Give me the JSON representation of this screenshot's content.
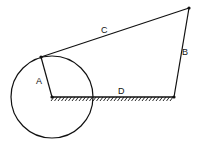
{
  "diagram": {
    "type": "four-bar linkage",
    "colors": {
      "stroke": "#111111",
      "background": "#ffffff"
    },
    "circle": {
      "cx": 52,
      "cy": 97,
      "r": 41
    },
    "points": {
      "ground_left": [
        52,
        97
      ],
      "crank_tip": [
        41,
        57
      ],
      "coupler_right": [
        189,
        8
      ],
      "ground_right": [
        174,
        97
      ]
    },
    "links": [
      {
        "id": "A",
        "label": "A",
        "from": "ground_left",
        "to": "crank_tip",
        "label_pos": [
          31,
          81
        ]
      },
      {
        "id": "B",
        "label": "B",
        "from": "ground_right",
        "to": "coupler_right",
        "label_pos": [
          183,
          55
        ]
      },
      {
        "id": "C",
        "label": "C",
        "from": "crank_tip",
        "to": "coupler_right",
        "label_pos": [
          102,
          33
        ]
      },
      {
        "id": "D",
        "label": "D",
        "from": "ground_left",
        "to": "ground_right",
        "label_pos": [
          118,
          94
        ]
      }
    ],
    "ground_hatch": {
      "x1": 52,
      "x2": 174,
      "y": 97
    }
  }
}
